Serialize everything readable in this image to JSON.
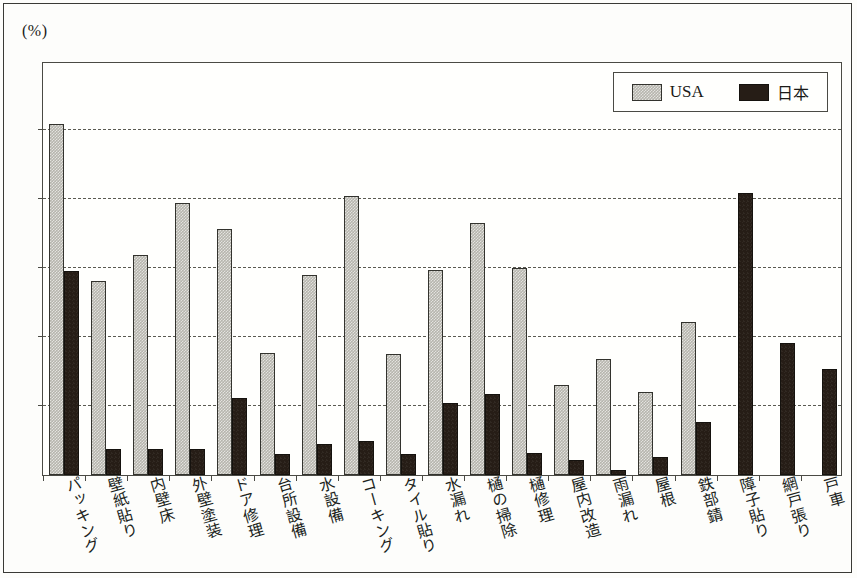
{
  "figure": {
    "unit_label": "(%)",
    "background_color": "#fdfdfb",
    "frame_color": "#3a3a36"
  },
  "legend": {
    "position": "top-right",
    "entries": [
      {
        "label": "USA",
        "color": "#b6b5ad",
        "pattern": "checker-light-gray"
      },
      {
        "label": "日本",
        "color": "#261d16",
        "pattern": "solid-dark"
      }
    ]
  },
  "chart_data": {
    "type": "bar",
    "title": "",
    "subtitle": "",
    "xlabel": "",
    "ylabel": "(%)",
    "ylim": [
      0,
      60
    ],
    "yticks": [
      0,
      10,
      20,
      30,
      40,
      50,
      60
    ],
    "grid": true,
    "grid_style": "dashed-horizontal",
    "legend_position": "top-right",
    "categories": [
      "パッキング",
      "壁紙貼り",
      "内壁床",
      "外壁塗装",
      "ドア修理",
      "台所設備",
      "水設備",
      "コーキング",
      "タイル貼り",
      "水漏れ",
      "樋の掃除",
      "樋修理",
      "屋内改造",
      "雨漏れ",
      "屋根",
      "鉄部錆",
      "障子貼り",
      "網戸張り",
      "戸車"
    ],
    "series": [
      {
        "name": "USA",
        "color": "#b6b5ad",
        "values": [
          50.9,
          28.1,
          31.9,
          39.4,
          35.6,
          17.7,
          29.0,
          40.4,
          17.6,
          29.7,
          36.5,
          30.0,
          13.0,
          16.8,
          12.0,
          22.2,
          0,
          0,
          0
        ]
      },
      {
        "name": "日本",
        "color": "#261d16",
        "values": [
          29.5,
          3.8,
          3.8,
          3.7,
          11.2,
          3.0,
          4.5,
          5.0,
          3.0,
          10.4,
          11.7,
          3.2,
          2.2,
          0.7,
          2.6,
          7.7,
          40.8,
          19.2,
          15.3
        ]
      }
    ]
  }
}
